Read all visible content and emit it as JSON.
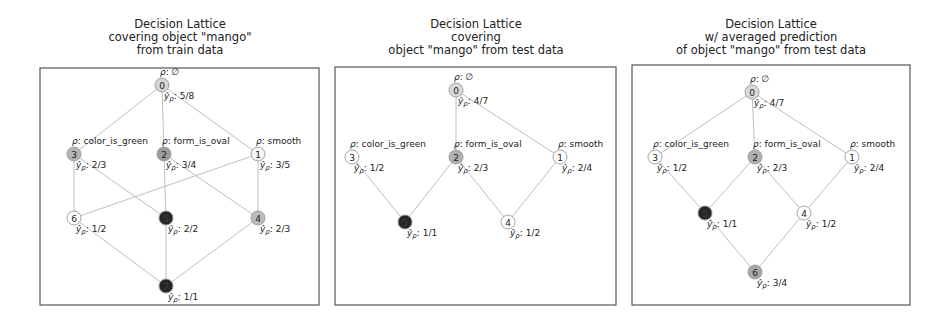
{
  "panels": [
    {
      "title_lines": [
        "Decision Lattice",
        "covering object \"mango\"",
        "from train data"
      ],
      "title_pos": {
        "x": 40,
        "y": 18,
        "w": 280
      },
      "box": {
        "x": 40,
        "y": 68,
        "w": 279,
        "h": 237
      },
      "nodes": [
        {
          "id": "0",
          "x": 162,
          "y": 85,
          "fill": "#d4d4d4",
          "premise": "ρ: ∅",
          "pred": "5/8"
        },
        {
          "id": "1",
          "x": 258,
          "y": 154,
          "fill": "#f4f4f4",
          "premise": "ρ: smooth",
          "pred": "3/5"
        },
        {
          "id": "2",
          "x": 164,
          "y": 154,
          "fill": "#9a9a9a",
          "premise": "ρ: form_is_oval",
          "pred": "3/4"
        },
        {
          "id": "3",
          "x": 74,
          "y": 154,
          "fill": "#b4b4b4",
          "premise": "ρ: color_is_green",
          "pred": "2/3"
        },
        {
          "id": "4",
          "x": 258,
          "y": 218,
          "fill": "#bdbdbd",
          "premise": "",
          "pred": "2/3"
        },
        {
          "id": "5",
          "x": 166,
          "y": 218,
          "fill": "#262626",
          "premise": "",
          "pred": "2/2"
        },
        {
          "id": "6",
          "x": 74,
          "y": 218,
          "fill": "#ffffff",
          "premise": "",
          "pred": "1/2"
        },
        {
          "id": "7",
          "x": 166,
          "y": 286,
          "fill": "#262626",
          "premise": "",
          "pred": "1/1"
        }
      ],
      "edges": [
        [
          "0",
          "3"
        ],
        [
          "0",
          "2"
        ],
        [
          "0",
          "1"
        ],
        [
          "3",
          "6"
        ],
        [
          "3",
          "5"
        ],
        [
          "2",
          "5"
        ],
        [
          "2",
          "4"
        ],
        [
          "1",
          "6"
        ],
        [
          "1",
          "4"
        ],
        [
          "6",
          "7"
        ],
        [
          "5",
          "7"
        ],
        [
          "4",
          "7"
        ]
      ]
    },
    {
      "title_lines": [
        "Decision Lattice",
        "covering",
        "object \"mango\" from test data"
      ],
      "title_pos": {
        "x": 335,
        "y": 18,
        "w": 282
      },
      "box": {
        "x": 335,
        "y": 67,
        "w": 281,
        "h": 238
      },
      "nodes": [
        {
          "id": "0",
          "x": 456,
          "y": 90,
          "fill": "#d9d9d9",
          "premise": "ρ: ∅",
          "pred": "4/7"
        },
        {
          "id": "1",
          "x": 560,
          "y": 157,
          "fill": "#ffffff",
          "premise": "ρ: smooth",
          "pred": "2/4"
        },
        {
          "id": "2",
          "x": 456,
          "y": 157,
          "fill": "#b0b0b0",
          "premise": "ρ: form_is_oval",
          "pred": "2/3"
        },
        {
          "id": "3",
          "x": 352,
          "y": 157,
          "fill": "#ffffff",
          "premise": "ρ: color_is_green",
          "pred": "1/2"
        },
        {
          "id": "4",
          "x": 508,
          "y": 222,
          "fill": "#ffffff",
          "premise": "",
          "pred": "1/2"
        },
        {
          "id": "5",
          "x": 405,
          "y": 222,
          "fill": "#262626",
          "premise": "",
          "pred": "1/1"
        }
      ],
      "edges": [
        [
          "0",
          "2"
        ],
        [
          "0",
          "1"
        ],
        [
          "3",
          "5"
        ],
        [
          "2",
          "5"
        ],
        [
          "2",
          "4"
        ],
        [
          "1",
          "4"
        ]
      ]
    },
    {
      "title_lines": [
        "Decision Lattice",
        "w/ averaged prediction",
        "of object \"mango\" from test data"
      ],
      "title_pos": {
        "x": 632,
        "y": 18,
        "w": 278
      },
      "box": {
        "x": 632,
        "y": 65,
        "w": 278,
        "h": 240
      },
      "nodes": [
        {
          "id": "0",
          "x": 752,
          "y": 92,
          "fill": "#d9d9d9",
          "premise": "ρ: ∅",
          "pred": "4/7"
        },
        {
          "id": "1",
          "x": 852,
          "y": 157,
          "fill": "#ffffff",
          "premise": "ρ: smooth",
          "pred": "2/4"
        },
        {
          "id": "2",
          "x": 755,
          "y": 157,
          "fill": "#b0b0b0",
          "premise": "ρ: form_is_oval",
          "pred": "2/3"
        },
        {
          "id": "3",
          "x": 655,
          "y": 157,
          "fill": "#ffffff",
          "premise": "ρ: color_is_green",
          "pred": "1/2"
        },
        {
          "id": "4",
          "x": 804,
          "y": 213,
          "fill": "#ffffff",
          "premise": "",
          "pred": "1/2"
        },
        {
          "id": "5",
          "x": 705,
          "y": 213,
          "fill": "#262626",
          "premise": "",
          "pred": "1/1"
        },
        {
          "id": "6",
          "x": 755,
          "y": 272,
          "fill": "#a8a8a8",
          "premise": "",
          "pred": "3/4"
        }
      ],
      "edges": [
        [
          "0",
          "3"
        ],
        [
          "0",
          "2"
        ],
        [
          "0",
          "1"
        ],
        [
          "3",
          "5"
        ],
        [
          "2",
          "5"
        ],
        [
          "2",
          "4"
        ],
        [
          "1",
          "4"
        ],
        [
          "5",
          "6",
          "faint"
        ],
        [
          "4",
          "6",
          "faint"
        ]
      ]
    }
  ],
  "pred_symbol": "ŷ",
  "pred_subscript": "ρ"
}
